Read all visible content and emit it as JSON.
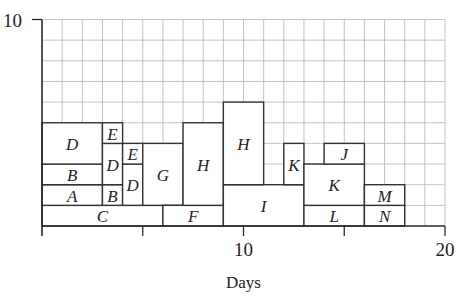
{
  "chart_data": {
    "type": "bar",
    "subtype": "resource-histogram",
    "title": "",
    "xlabel": "Days",
    "ylabel": "",
    "xlim": [
      0,
      20
    ],
    "ylim": [
      0,
      10
    ],
    "x_tick_labels": [
      {
        "value": 10,
        "label": "10"
      },
      {
        "value": 20,
        "label": "20"
      }
    ],
    "x_ticks": [
      0,
      5,
      10,
      15,
      20
    ],
    "y_tick_labels": [
      {
        "value": 10,
        "label": "10"
      }
    ],
    "grid": true,
    "grid_step": {
      "x": 1,
      "y": 1
    },
    "legend": null,
    "blocks": [
      {
        "label": "C",
        "x_start": 0,
        "x_end": 6,
        "y_bottom": 0,
        "y_top": 1
      },
      {
        "label": "A",
        "x_start": 0,
        "x_end": 3,
        "y_bottom": 1,
        "y_top": 2
      },
      {
        "label": "B",
        "x_start": 0,
        "x_end": 3,
        "y_bottom": 2,
        "y_top": 3
      },
      {
        "label": "D",
        "x_start": 0,
        "x_end": 3,
        "y_bottom": 3,
        "y_top": 5
      },
      {
        "label": "B",
        "x_start": 3,
        "x_end": 4,
        "y_bottom": 1,
        "y_top": 2
      },
      {
        "label": "D",
        "x_start": 3,
        "x_end": 4,
        "y_bottom": 2,
        "y_top": 4
      },
      {
        "label": "E",
        "x_start": 3,
        "x_end": 4,
        "y_bottom": 4,
        "y_top": 5
      },
      {
        "label": "D",
        "x_start": 4,
        "x_end": 5,
        "y_bottom": 1,
        "y_top": 3
      },
      {
        "label": "E",
        "x_start": 4,
        "x_end": 5,
        "y_bottom": 3,
        "y_top": 4
      },
      {
        "label": "G",
        "x_start": 5,
        "x_end": 7,
        "y_bottom": 1,
        "y_top": 4
      },
      {
        "label": "F",
        "x_start": 6,
        "x_end": 9,
        "y_bottom": 0,
        "y_top": 1
      },
      {
        "label": "H",
        "x_start": 7,
        "x_end": 9,
        "y_bottom": 1,
        "y_top": 5
      },
      {
        "label": "I",
        "x_start": 9,
        "x_end": 13,
        "y_bottom": 0,
        "y_top": 2
      },
      {
        "label": "H",
        "x_start": 9,
        "x_end": 11,
        "y_bottom": 2,
        "y_top": 6
      },
      {
        "label": "K",
        "x_start": 12,
        "x_end": 13,
        "y_bottom": 2,
        "y_top": 4
      },
      {
        "label": "L",
        "x_start": 13,
        "x_end": 16,
        "y_bottom": 0,
        "y_top": 1
      },
      {
        "label": "K",
        "x_start": 13,
        "x_end": 16,
        "y_bottom": 1,
        "y_top": 3
      },
      {
        "label": "J",
        "x_start": 14,
        "x_end": 16,
        "y_bottom": 3,
        "y_top": 4
      },
      {
        "label": "N",
        "x_start": 16,
        "x_end": 18,
        "y_bottom": 0,
        "y_top": 1
      },
      {
        "label": "M",
        "x_start": 16,
        "x_end": 18,
        "y_bottom": 1,
        "y_top": 2
      }
    ],
    "daily_totals": {
      "x": [
        1,
        2,
        3,
        4,
        5,
        6,
        7,
        8,
        9,
        10,
        11,
        12,
        13,
        14,
        15,
        16,
        17,
        18,
        19,
        20
      ],
      "values": [
        5,
        5,
        5,
        5,
        5,
        4,
        5,
        5,
        5,
        6,
        6,
        4,
        4,
        3,
        4,
        4,
        2,
        2,
        0,
        0
      ]
    }
  }
}
